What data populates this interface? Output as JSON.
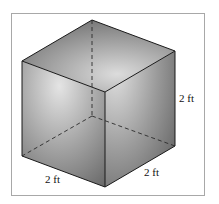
{
  "figure": {
    "type": "cube",
    "labels": {
      "height": "2 ft",
      "width_left": "2 ft",
      "width_right": "2 ft"
    },
    "colors": {
      "edge": "#1a1a1a",
      "frame": "#a8a8a8",
      "face_light": "#e2e2e2",
      "face_dark": "#6a6a6a"
    }
  }
}
